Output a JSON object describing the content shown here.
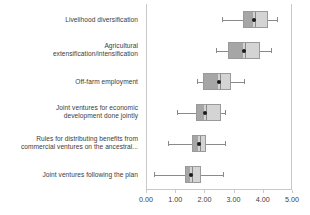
{
  "chart_data": {
    "type": "boxplot",
    "title": "",
    "xlabel": "",
    "ylabel": "",
    "xlim": [
      0.0,
      5.0
    ],
    "xticks": [
      0.0,
      1.0,
      2.0,
      3.0,
      4.0,
      5.0
    ],
    "xtick_labels": [
      "0.00",
      "1.00",
      "2.00",
      "3.00",
      "4.00",
      "5.00"
    ],
    "grid": false,
    "legend": "none",
    "orientation": "horizontal",
    "marker": "mean-dot",
    "categories": [
      "Livelihood diversification",
      "Agricultural extensification/intensification",
      "Off-farm employment",
      "Joint ventures for economic development done jointly",
      "Rules for distributing benefits from commercial ventures on the ancestral...",
      "Joint ventures following the plan"
    ],
    "category_lines": [
      [
        "Livelihood diversification"
      ],
      [
        "Agricultural",
        "extensification/intensification"
      ],
      [
        "Off-farm employment"
      ],
      [
        "Joint ventures for economic",
        "development done jointly"
      ],
      [
        "Rules for distributing benefits from",
        "commercial ventures on the ancestral..."
      ],
      [
        "Joint ventures following the plan"
      ]
    ],
    "boxes": [
      {
        "category": "Livelihood diversification",
        "whisker_low": 2.58,
        "q1": 3.28,
        "median": 3.68,
        "q3": 4.14,
        "whisker_high": 4.45,
        "mean": 3.68
      },
      {
        "category": "Agricultural extensification/intensification",
        "whisker_low": 2.38,
        "q1": 2.78,
        "median": 3.33,
        "q3": 3.87,
        "whisker_high": 4.24,
        "mean": 3.33
      },
      {
        "category": "Off-farm employment",
        "whisker_low": 1.71,
        "q1": 1.93,
        "median": 2.47,
        "q3": 2.87,
        "whisker_high": 3.33,
        "mean": 2.47
      },
      {
        "category": "Joint ventures for economic development done jointly",
        "whisker_low": 1.02,
        "q1": 1.68,
        "median": 1.98,
        "q3": 2.53,
        "whisker_high": 2.67,
        "mean": 1.98
      },
      {
        "category": "Rules for distributing benefits from commercial ventures on the ancestral...",
        "whisker_low": 0.73,
        "q1": 1.55,
        "median": 1.77,
        "q3": 2.01,
        "whisker_high": 2.67,
        "mean": 1.77
      },
      {
        "category": "Joint ventures following the plan",
        "whisker_low": 0.25,
        "q1": 1.3,
        "median": 1.52,
        "q3": 1.86,
        "whisker_high": 2.61,
        "mean": 1.52
      }
    ],
    "colors": {
      "box_lower_fill": "#a6a6a6",
      "box_upper_fill": "#d4d4d4",
      "box_border": "#9a9a9a",
      "whisker": "#8a8a8a",
      "marker": "#1a1a1a",
      "axis": "#c9c9c9",
      "text": "#3c3c3c"
    }
  }
}
